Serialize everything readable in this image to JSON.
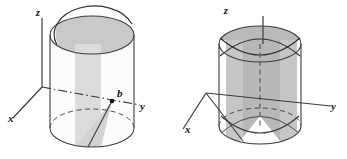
{
  "figure": {
    "background_color": "#ffffff",
    "width": 347,
    "height": 159,
    "stroke_color": "#3c3c3c",
    "label_color": "#1a1a1a",
    "shading": {
      "plane_light": "#dadada",
      "plane_medium": "#c3c3c3",
      "plane_dark": "#b0b0b0",
      "cylinder_body": "#fbfbfb"
    }
  },
  "panels": [
    {
      "id": "left",
      "name": "cylinder-single-cut-plane",
      "axes": [
        {
          "name": "z-axis",
          "label": "z",
          "label_x": 38,
          "label_y": 16
        },
        {
          "name": "y-axis",
          "label": "y",
          "label_x": 140,
          "label_y": 110
        },
        {
          "name": "x-axis",
          "label": "x",
          "label_x": 8,
          "label_y": 122
        }
      ],
      "points": [
        {
          "name": "point-b",
          "label": "b",
          "label_x": 117,
          "label_y": 97,
          "dot_x": 112,
          "dot_y": 101
        }
      ],
      "description": "Vertical cylinder on the xy-plane sliced by a single slanted plane through the y-axis at point b; the cut region is shaded."
    },
    {
      "id": "right",
      "name": "cylinder-double-cut-planes",
      "axes": [
        {
          "name": "z-axis",
          "label": "z",
          "label_x": 226,
          "label_y": 14
        },
        {
          "name": "y-axis",
          "label": "y",
          "label_x": 331,
          "label_y": 110
        },
        {
          "name": "x-axis",
          "label": "x",
          "label_x": 185,
          "label_y": 133
        }
      ],
      "points": [],
      "description": "Vertical cylinder sliced by two intersecting slanted planes forming a saddle-shaped solid; shaded front and back cut faces."
    }
  ]
}
